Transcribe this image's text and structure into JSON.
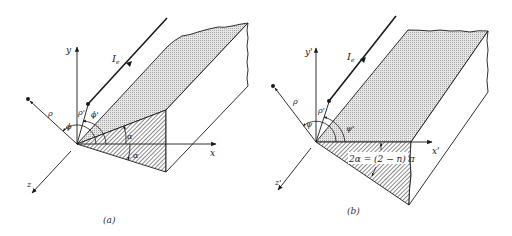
{
  "figure": {
    "colors": {
      "line": "#1a1a1a",
      "face_fill": "#d9d9d9",
      "hatch": "#2a2a2a",
      "background": "#ffffff"
    },
    "panels": [
      {
        "id": "a",
        "caption": "(a)",
        "labels": {
          "y_axis": "y",
          "x_axis": "x",
          "z_axis": "z",
          "rho": "ρ",
          "rho_prime": "ρ'",
          "phi": "ϕ",
          "phi_prime": "ϕ'",
          "alpha_top": "α",
          "alpha_bottom": "α",
          "source": "I",
          "source_sub": "e"
        }
      },
      {
        "id": "b",
        "caption": "(b)",
        "labels": {
          "y_axis": "y'",
          "x_axis": "x'",
          "z_axis": "z'",
          "rho": "ρ",
          "rho_prime": "ρ'",
          "phi": "ψ",
          "phi_prime": "ψ'",
          "wedge_angle": "2α = (2 − n) π",
          "source": "I",
          "source_sub": "e"
        }
      }
    ]
  }
}
